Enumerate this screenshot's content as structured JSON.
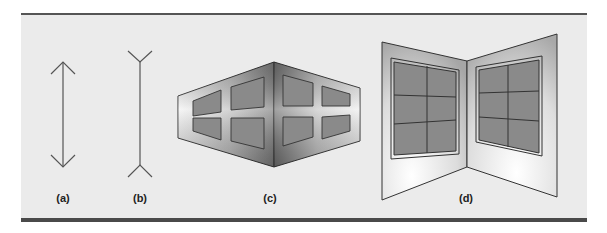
{
  "figure": {
    "panels": [
      {
        "id": "a",
        "label": "(a)",
        "description": "Muller-Lyer line with outward arrowheads"
      },
      {
        "id": "b",
        "label": "(b)",
        "description": "Muller-Lyer line with inward fins"
      },
      {
        "id": "c",
        "label": "(c)",
        "description": "Outside corner of building with windows"
      },
      {
        "id": "d",
        "label": "(d)",
        "description": "Inside corner of room with windows"
      }
    ],
    "colors": {
      "background": "#ebebeb",
      "line": "#444444",
      "window_fill": "#8a8a8a",
      "rule": "#4a4a4a"
    }
  }
}
